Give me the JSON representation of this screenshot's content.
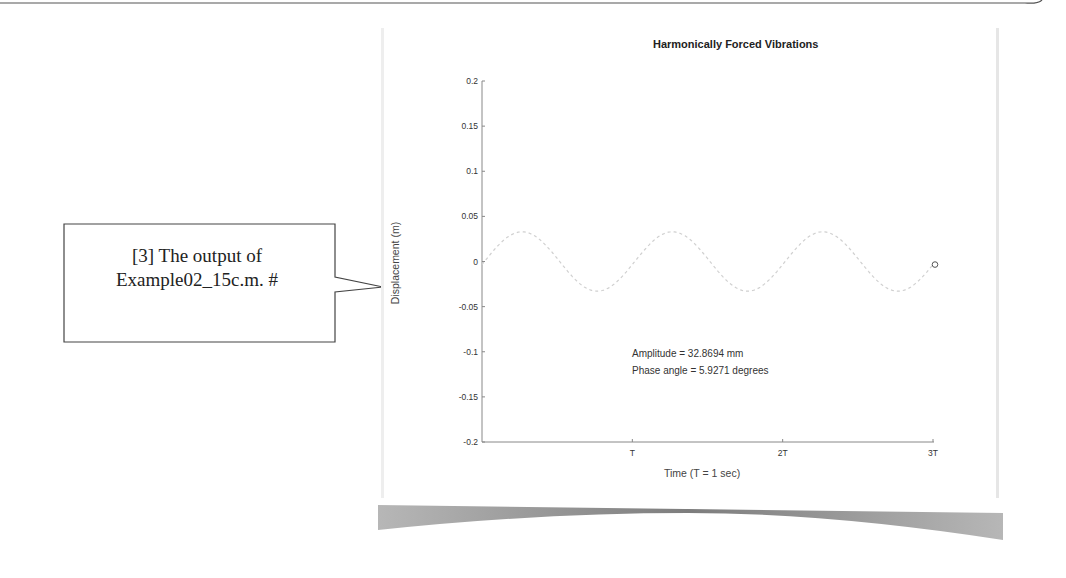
{
  "callout": {
    "line1": "[3] The output of",
    "line2": "Example02_15c.m.  #"
  },
  "chart_data": {
    "type": "line",
    "title": "Harmonically Forced Vibrations",
    "xlabel": "Time (T = 1 sec)",
    "ylabel": "Displacement (m)",
    "xlim": [
      0,
      3
    ],
    "ylim": [
      -0.2,
      0.2
    ],
    "x_ticks": [
      "T",
      "2T",
      "3T"
    ],
    "x_tick_values": [
      1,
      2,
      3
    ],
    "y_ticks": [
      "0.2",
      "0.15",
      "0.1",
      "0.05",
      "0",
      "-0.05",
      "-0.1",
      "-0.15",
      "-0.2"
    ],
    "y_tick_values": [
      0.2,
      0.15,
      0.1,
      0.05,
      0,
      -0.05,
      -0.1,
      -0.15,
      -0.2
    ],
    "grid": false,
    "series": [
      {
        "name": "displacement",
        "amplitude_m": 0.0328694,
        "period": 1,
        "phase_deg": 5.9271,
        "color": "#cccccc",
        "end_marker": "circle"
      }
    ],
    "annotations": [
      "Amplitude = 32.8694 mm",
      "Phase angle = 5.9271 degrees"
    ]
  },
  "plot": {
    "title": "Harmonically Forced Vibrations",
    "xlabel": "Time (T = 1 sec)",
    "ylabel": "Displacement (m)",
    "amplitude_text": "Amplitude = 32.8694 mm",
    "phase_text": "Phase angle = 5.9271 degrees"
  }
}
